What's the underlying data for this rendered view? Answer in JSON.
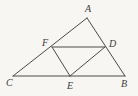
{
  "figure": {
    "type": "geometry-diagram",
    "background_color": "#f7f6f3",
    "stroke_color": "#4a4a4a",
    "label_color": "#3b3b3b",
    "points": [
      {
        "name": "A",
        "label": "A",
        "x": 87,
        "y": 18,
        "label_x": 85,
        "label_y": 4
      },
      {
        "name": "B",
        "label": "B",
        "x": 125,
        "y": 76,
        "label_x": 121,
        "label_y": 79
      },
      {
        "name": "C",
        "label": "C",
        "x": 13,
        "y": 76,
        "label_x": 6,
        "label_y": 78
      },
      {
        "name": "D",
        "label": "D",
        "x": 105,
        "y": 47,
        "label_x": 109,
        "label_y": 39
      },
      {
        "name": "E",
        "label": "E",
        "x": 70,
        "y": 76,
        "label_x": 67,
        "label_y": 81
      },
      {
        "name": "F",
        "label": "F",
        "x": 52,
        "y": 47,
        "label_x": 42,
        "label_y": 38
      }
    ],
    "segments": [
      {
        "name": "segment-AC",
        "from": "A",
        "to": "C",
        "x1": 87,
        "y1": 18,
        "x2": 13,
        "y2": 76
      },
      {
        "name": "segment-AB",
        "from": "A",
        "to": "B",
        "x1": 87,
        "y1": 18,
        "x2": 125,
        "y2": 76
      },
      {
        "name": "segment-CB",
        "from": "C",
        "to": "B",
        "x1": 13,
        "y1": 76,
        "x2": 125,
        "y2": 76
      },
      {
        "name": "segment-FD",
        "from": "F",
        "to": "D",
        "x1": 52,
        "y1": 47,
        "x2": 105,
        "y2": 47
      },
      {
        "name": "segment-FE",
        "from": "F",
        "to": "E",
        "x1": 52,
        "y1": 47,
        "x2": 70,
        "y2": 76
      },
      {
        "name": "segment-DE",
        "from": "D",
        "to": "E",
        "x1": 105,
        "y1": 47,
        "x2": 70,
        "y2": 76
      }
    ]
  }
}
